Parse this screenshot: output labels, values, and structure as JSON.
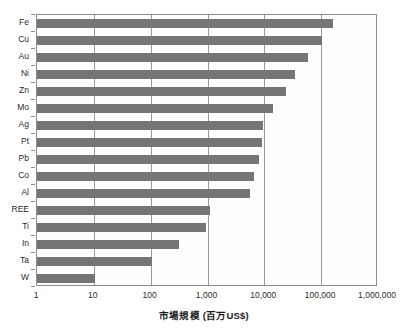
{
  "chart_data": {
    "type": "bar",
    "orientation": "horizontal",
    "title": "",
    "xlabel": "市場規模 (百万US$)",
    "ylabel": "",
    "xscale": "log",
    "xlim": [
      1,
      1000000
    ],
    "xticks": [
      1,
      10,
      100,
      1000,
      10000,
      100000,
      1000000
    ],
    "xtick_labels": [
      "1",
      "10",
      "100",
      "1,000",
      "10,000",
      "100,000",
      "1,000,000"
    ],
    "grid": "vertical",
    "legend": null,
    "bar_color": "#757575",
    "plot_border_color": "#8c8c8c",
    "categories": [
      "Fe",
      "Cu",
      "Au",
      "Ni",
      "Zn",
      "Mo",
      "Ag",
      "Pt",
      "Pb",
      "Co",
      "Al",
      "REE",
      "Ti",
      "In",
      "Ta",
      "W"
    ],
    "values": [
      160000,
      103000,
      58000,
      34000,
      24000,
      14000,
      9400,
      9000,
      8200,
      6700,
      5700,
      1100,
      940,
      315,
      104,
      10.3
    ]
  },
  "axis": {
    "x_title": "市場規模 (百万US$)",
    "tick_labels": [
      "1",
      "10",
      "100",
      "1,000",
      "10,000",
      "100,000",
      "1,000,000"
    ],
    "category_labels": [
      "Fe",
      "Cu",
      "Au",
      "Ni",
      "Zn",
      "Mo",
      "Ag",
      "Pt",
      "Pb",
      "Co",
      "Al",
      "REE",
      "Ti",
      "In",
      "Ta",
      "W"
    ]
  }
}
